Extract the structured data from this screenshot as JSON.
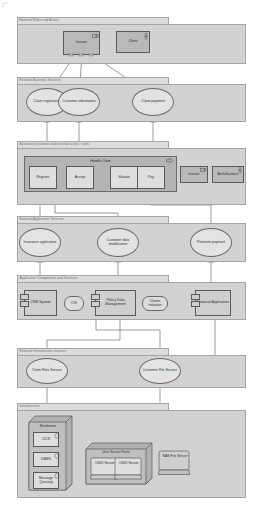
{
  "diagram": {
    "type": "archimate-layered-architecture"
  },
  "colors": {
    "band_fill": "#d2d2d2",
    "band_tab_fill": "#dcdcdc",
    "band_border": "#9a9a9a",
    "node_fill": "#cfcfcf",
    "node_fill_dark": "#b9b9b9",
    "node_fill_light": "#e3e3e3",
    "node_border": "#58595b",
    "line": "#4a4a4a",
    "label": "#2b2b2b",
    "band_label": "#6d6d6d"
  },
  "bands": [
    {
      "id": "external-roles-actors",
      "label": "External Roles and Actors"
    },
    {
      "id": "external-business-services",
      "label": "External Business Services"
    },
    {
      "id": "business-processes",
      "label": "Business processes and internal actors / roles"
    },
    {
      "id": "external-application-services",
      "label": "External Application Services"
    },
    {
      "id": "application-components",
      "label": "Application Components and Services"
    },
    {
      "id": "external-infrastructure-services",
      "label": "External infrastructure services"
    },
    {
      "id": "infrastructure",
      "label": "Infrastructure"
    }
  ],
  "roles": {
    "insurer": {
      "label": "Insurer",
      "icon": "business-role-icon"
    },
    "client": {
      "label": "Client",
      "icon": "business-actor-icon"
    }
  },
  "business_services": [
    {
      "id": "claim-registration",
      "label": "Claim registration"
    },
    {
      "id": "customer-information",
      "label": "Customer information"
    },
    {
      "id": "claim-payment",
      "label": "Claim payment"
    }
  ],
  "process": {
    "group_label": "Handle Claim",
    "steps": [
      {
        "id": "register",
        "label": "Register"
      },
      {
        "id": "accept",
        "label": "Accept"
      },
      {
        "id": "valuate",
        "label": "Valuate"
      },
      {
        "id": "pay",
        "label": "Pay"
      }
    ],
    "actors": [
      {
        "id": "insurer-role",
        "label": "Insurer",
        "icon": "business-role-icon"
      },
      {
        "id": "archisurance",
        "label": "ArchiSurance",
        "icon": "business-actor-icon"
      }
    ]
  },
  "application_services": [
    {
      "id": "insurance-application",
      "label": "Insurance application"
    },
    {
      "id": "customer-data-modification",
      "label": "Customer data modification"
    },
    {
      "id": "premium-payment",
      "label": "Premium payment"
    }
  ],
  "application_components": [
    {
      "id": "crm-system",
      "label": "CRM System",
      "kind": "component"
    },
    {
      "id": "cis",
      "label": "CIS",
      "kind": "service"
    },
    {
      "id": "policy-data-management",
      "label": "Policy Data Management",
      "kind": "component"
    },
    {
      "id": "claims-initiation",
      "label": "Claims initiation",
      "kind": "service"
    },
    {
      "id": "financial-application",
      "label": "Financial Application",
      "kind": "component"
    }
  ],
  "infrastructure_services": [
    {
      "id": "claim-files-service",
      "label": "Claim Files Service"
    },
    {
      "id": "customer-file-service",
      "label": "Customer File Service"
    }
  ],
  "infrastructure": {
    "mainframe": {
      "label": "Mainframe",
      "nodes": [
        {
          "id": "cics",
          "label": "CICS"
        },
        {
          "id": "dbms",
          "label": "DBMS"
        },
        {
          "id": "message-queuing",
          "label": "Message Queuing"
        }
      ]
    },
    "unix_farm": {
      "label": "Unix Server Farm",
      "nodes": [
        {
          "id": "unix-server-1",
          "label": "UNIX Server"
        },
        {
          "id": "unix-server-2",
          "label": "UNIX Server"
        }
      ]
    },
    "nas": {
      "id": "nas-file-server",
      "label": "NAS File Server"
    }
  }
}
